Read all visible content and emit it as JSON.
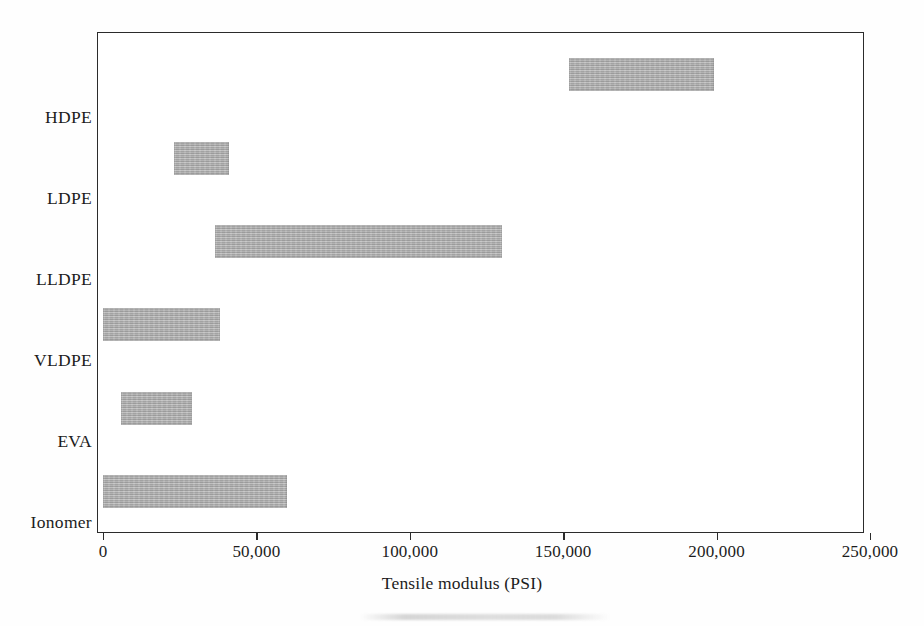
{
  "chart_data": {
    "type": "bar",
    "orientation": "horizontal",
    "subtype": "range-bar",
    "title": "",
    "xlabel": "Tensile modulus (PSI)",
    "ylabel": "",
    "xlim": [
      0,
      250000
    ],
    "xticks": [
      0,
      50000,
      100000,
      150000,
      200000,
      250000
    ],
    "xticklabels": [
      "0",
      "50,000",
      "100,000",
      "150,000",
      "200,000",
      "250,000"
    ],
    "grid": false,
    "legend": false,
    "bar_color": "#a9a9a9",
    "frame_color": "#2b2b2b",
    "categories": [
      "HDPE",
      "LDPE",
      "LLDPE",
      "VLDPE",
      "EVA",
      "Ionomer"
    ],
    "series": [
      {
        "name": "Tensile modulus range",
        "ranges": [
          {
            "category": "HDPE",
            "start": 152000,
            "end": 199000
          },
          {
            "category": "LDPE",
            "start": 23000,
            "end": 41000
          },
          {
            "category": "LLDPE",
            "start": 36500,
            "end": 130000
          },
          {
            "category": "VLDPE",
            "start": 0,
            "end": 38000
          },
          {
            "category": "EVA",
            "start": 6000,
            "end": 29000
          },
          {
            "category": "Ionomer",
            "start": 0,
            "end": 60000
          }
        ]
      }
    ]
  },
  "axis": {
    "x_title": "Tensile modulus (PSI)",
    "tick_labels": [
      "0",
      "50,000",
      "100,000",
      "150,000",
      "200,000",
      "250,000"
    ],
    "category_labels": [
      "HDPE",
      "LDPE",
      "LLDPE",
      "VLDPE",
      "EVA",
      "Ionomer"
    ]
  }
}
